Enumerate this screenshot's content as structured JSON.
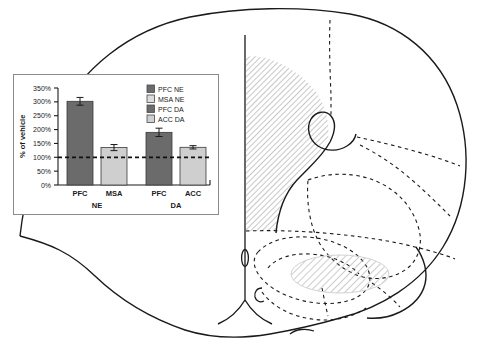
{
  "figure": {
    "brain": {
      "hatched_regions": [
        {
          "name": "prefrontal-cortex-region",
          "label": "PFC"
        },
        {
          "name": "accumbens-region",
          "label": "ACC"
        }
      ],
      "outline_color": "#1a1a1a",
      "hatch_color": "#9a9a9a",
      "dashed_color": "#1a1a1a"
    }
  },
  "chart_data": {
    "type": "bar",
    "title": "",
    "xlabel": "",
    "ylabel": "% of vehicle",
    "ylim": [
      0,
      350
    ],
    "ytick_values": [
      0,
      50,
      100,
      150,
      200,
      250,
      300,
      350
    ],
    "ytick_labels": [
      "0%",
      "50%",
      "100%",
      "150%",
      "200%",
      "250%",
      "300%",
      "350%"
    ],
    "grid": false,
    "legend_position": "top-right",
    "reference_line": {
      "value": 100,
      "style": "dashed",
      "color": "#111111"
    },
    "categories": [
      "PFC",
      "MSA",
      "PFC",
      "ACC"
    ],
    "groups": [
      {
        "label": "NE",
        "categories": [
          "PFC",
          "MSA"
        ]
      },
      {
        "label": "DA",
        "categories": [
          "PFC",
          "ACC"
        ]
      }
    ],
    "bars": [
      {
        "label": "PFC",
        "group": "NE",
        "series": "PFC NE",
        "value": 302,
        "error": 14,
        "color": "#6b6b6b"
      },
      {
        "label": "MSA",
        "group": "NE",
        "series": "MSA NE",
        "value": 135,
        "error": 11,
        "color": "#cfcfcf"
      },
      {
        "label": "PFC",
        "group": "DA",
        "series": "PFC DA",
        "value": 190,
        "error": 15,
        "color": "#6b6b6b"
      },
      {
        "label": "ACC",
        "group": "DA",
        "series": "ACC DA",
        "value": 136,
        "error": 6,
        "color": "#cfcfcf"
      }
    ],
    "legend": [
      {
        "label": "PFC NE",
        "color": "#6b6b6b"
      },
      {
        "label": "MSA NE",
        "color": "#dcdcdc"
      },
      {
        "label": "PFC DA",
        "color": "#6b6b6b"
      },
      {
        "label": "ACC DA",
        "color": "#cfcfcf"
      }
    ]
  }
}
